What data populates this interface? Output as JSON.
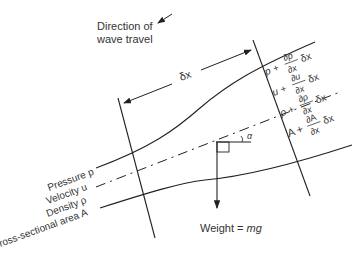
{
  "diagram": {
    "direction_label_line1": "Direction of",
    "direction_label_line2": "wave travel",
    "dx_label": "δx",
    "angle_label": "α",
    "weight_label_prefix": "Weight = ",
    "weight_label_value": "mg",
    "left_labels": {
      "pressure": "Pressure p",
      "velocity": "Velocity u",
      "density": "Density ρ",
      "area": "Cross-sectional area A"
    },
    "right_labels": {
      "pressure": {
        "base": "p +",
        "num": "∂p",
        "den": "∂x",
        "tail": "δx"
      },
      "velocity": {
        "base": "u +",
        "num": "∂u",
        "den": "∂x",
        "tail": "δx"
      },
      "density": {
        "base": "ρ +",
        "num": "∂ρ",
        "den": "∂x",
        "tail": "δx"
      },
      "area": {
        "base": "A +",
        "num": "∂A",
        "den": "∂x",
        "tail": "δx"
      }
    },
    "colors": {
      "line": "#222222",
      "text": "#333333"
    }
  }
}
